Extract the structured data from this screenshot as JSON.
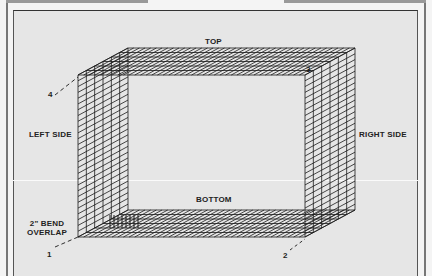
{
  "diagram": {
    "labels": {
      "top": "TOP",
      "bottom": "BOTTOM",
      "left_side": "LEFT SIDE",
      "right_side": "RIGHT SIDE",
      "bend_overlap_line1": "2\" BEND",
      "bend_overlap_line2": "OVERLAP"
    },
    "corners": [
      "1",
      "2",
      "3",
      "4"
    ],
    "colors": {
      "background": "#e6e6e6",
      "grid": "#1a1a1a",
      "text": "#222222"
    }
  }
}
